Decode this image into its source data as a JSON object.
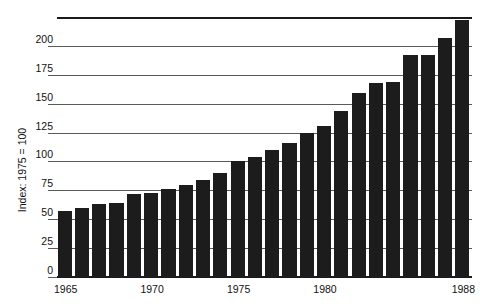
{
  "chart_data": {
    "type": "bar",
    "title": "",
    "subtitle": "",
    "xlabel": "",
    "ylabel": "Index: 1975 = 100",
    "ylim": [
      0,
      225
    ],
    "grid": true,
    "legend": false,
    "y_ticks": [
      0,
      25,
      50,
      75,
      100,
      125,
      150,
      175,
      200
    ],
    "y_tick_labels": [
      "0",
      "25",
      "50",
      "75",
      "100",
      "125",
      "150",
      "175",
      "200"
    ],
    "x_tick_labels": [
      "1965",
      "1970",
      "1975",
      "1980",
      "1988"
    ],
    "x_tick_categories": [
      "1965",
      "1970",
      "1975",
      "1980",
      "1988"
    ],
    "categories": [
      "1965",
      "1966",
      "1967",
      "1968",
      "1969",
      "1970",
      "1971",
      "1972",
      "1973",
      "1974",
      "1975",
      "1976",
      "1977",
      "1978",
      "1979",
      "1980",
      "1981",
      "1982",
      "1983",
      "1984",
      "1985",
      "1986",
      "1987",
      "1988"
    ],
    "values": [
      57,
      60,
      63,
      64,
      72,
      73,
      76,
      80,
      84,
      90,
      100,
      104,
      110,
      116,
      125,
      131,
      144,
      159,
      168,
      169,
      192,
      192,
      207,
      222
    ],
    "bar_color": "#1c1c1c",
    "background_color": "#ffffff",
    "axis_color": "#1a1a1a",
    "gridline_color": "#5a5a5a"
  },
  "axis": {
    "y_title": "Index: 1975 = 100"
  }
}
